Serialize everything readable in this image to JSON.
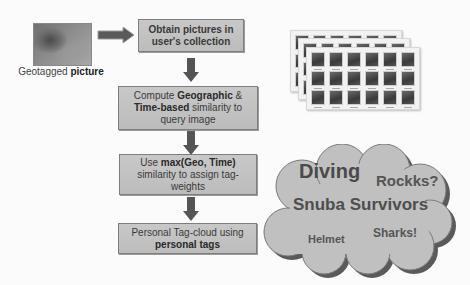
{
  "input": {
    "caption_prefix": "Geotagged ",
    "caption_bold": "picture"
  },
  "steps": [
    {
      "id": "obtain",
      "text": "Obtain pictures in user's collection"
    },
    {
      "id": "compute",
      "parts": [
        "Compute ",
        "Geographic",
        " & ",
        "Time-based",
        " similarity to query image"
      ]
    },
    {
      "id": "max",
      "parts": [
        "Use ",
        "max(Geo, Time)",
        " similarity to assign tag-weights"
      ]
    },
    {
      "id": "cloud",
      "parts": [
        "Personal Tag-cloud using ",
        "personal tags"
      ]
    }
  ],
  "photo_stack": {
    "layers": 3,
    "columns": 6,
    "rows": 3
  },
  "tag_cloud": {
    "tags": [
      {
        "text": "Diving",
        "size": "large"
      },
      {
        "text": "Rockks?",
        "size": "medium"
      },
      {
        "text": "Snuba Survivors",
        "size": "large"
      },
      {
        "text": "Helmet",
        "size": "small"
      },
      {
        "text": "Sharks!",
        "size": "small"
      }
    ]
  },
  "colors": {
    "box_fill": "#c4c4c4",
    "box_border": "#7e7e7e",
    "arrow_fill": "#555555",
    "cloud_fill": "#c0c0c0",
    "cloud_shadow": "#5a5a5a"
  }
}
